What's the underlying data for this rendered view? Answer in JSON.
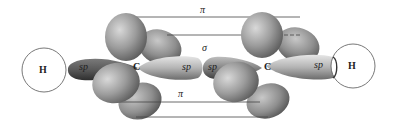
{
  "diagram": {
    "type": "orbital-diagram",
    "atoms": [
      {
        "id": "H1",
        "label": "H"
      },
      {
        "id": "C1",
        "label": "C"
      },
      {
        "id": "C2",
        "label": "C"
      },
      {
        "id": "H2",
        "label": "H"
      }
    ],
    "orbital_labels": {
      "sp_left_outer": "sp",
      "sp_c1_right": "sp",
      "sp_c2_left": "sp",
      "sp_right_outer": "sp"
    },
    "bond_labels": {
      "pi_top": "π",
      "sigma": "σ",
      "pi_bottom": "π"
    },
    "colors": {
      "background": "#ffffff",
      "lobe_light": "#d6d6d6",
      "lobe_mid": "#9a9a9a",
      "lobe_dark": "#5a5a5a",
      "line": "#333333"
    }
  }
}
